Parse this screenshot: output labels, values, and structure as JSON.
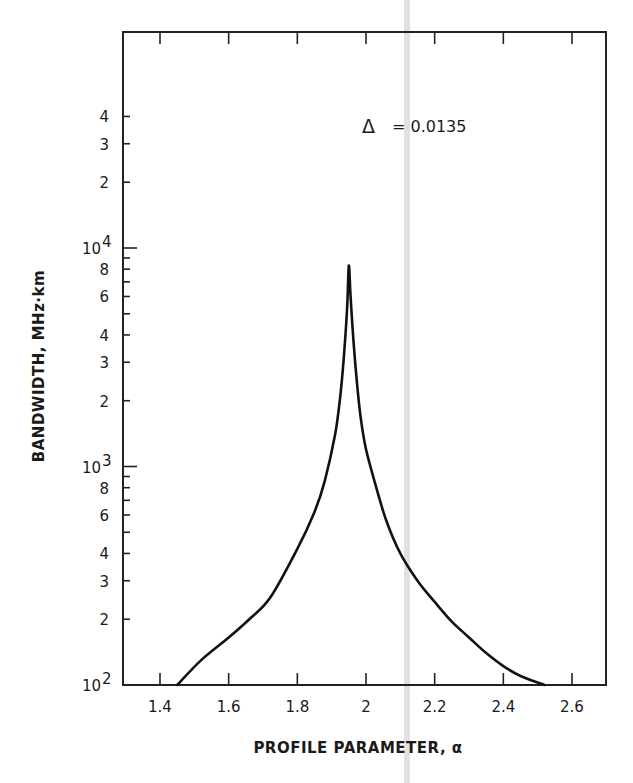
{
  "chart_data": {
    "type": "line",
    "title": "",
    "annotation": {
      "symbol": "Δ",
      "text": "=  0.0135",
      "label": "Δ = 0.0135"
    },
    "xlabel": "PROFILE PARAMETER, α",
    "ylabel": "BANDWIDTH, MHz·km",
    "xlim": [
      1.34,
      2.7
    ],
    "ylim": [
      100,
      50000
    ],
    "yscale": "log",
    "grid": false,
    "legend": "none",
    "x_ticks": [
      {
        "value": 1.4,
        "label": "1.4"
      },
      {
        "value": 1.6,
        "label": "1.6"
      },
      {
        "value": 1.8,
        "label": "1.8"
      },
      {
        "value": 2.0,
        "label": "2"
      },
      {
        "value": 2.2,
        "label": "2.2"
      },
      {
        "value": 2.4,
        "label": "2.4"
      },
      {
        "value": 2.6,
        "label": "2.6"
      }
    ],
    "y_ticks": [
      {
        "value": 100,
        "label": "10",
        "sup": "2",
        "major": true
      },
      {
        "value": 200,
        "label": "2"
      },
      {
        "value": 300,
        "label": "3"
      },
      {
        "value": 400,
        "label": "4"
      },
      {
        "value": 500,
        "label": ""
      },
      {
        "value": 600,
        "label": "6"
      },
      {
        "value": 700,
        "label": ""
      },
      {
        "value": 800,
        "label": "8"
      },
      {
        "value": 900,
        "label": ""
      },
      {
        "value": 1000,
        "label": "10",
        "sup": "3",
        "major": true
      },
      {
        "value": 2000,
        "label": "2"
      },
      {
        "value": 3000,
        "label": "3"
      },
      {
        "value": 4000,
        "label": "4"
      },
      {
        "value": 5000,
        "label": ""
      },
      {
        "value": 6000,
        "label": "6"
      },
      {
        "value": 7000,
        "label": ""
      },
      {
        "value": 8000,
        "label": "8"
      },
      {
        "value": 9000,
        "label": ""
      },
      {
        "value": 10000,
        "label": "10",
        "sup": "4",
        "major": true
      },
      {
        "value": 20000,
        "label": "2"
      },
      {
        "value": 30000,
        "label": "3"
      },
      {
        "value": 40000,
        "label": "4"
      }
    ],
    "series": [
      {
        "name": "Δ = 0.0135",
        "x": [
          1.45,
          1.52,
          1.6,
          1.66,
          1.72,
          1.8,
          1.85,
          1.88,
          1.91,
          1.925,
          1.935,
          1.945,
          1.95,
          1.955,
          1.965,
          1.975,
          1.985,
          2.0,
          2.03,
          2.06,
          2.1,
          2.15,
          2.2,
          2.25,
          2.3,
          2.35,
          2.4,
          2.45,
          2.52
        ],
        "values": [
          100,
          130,
          165,
          200,
          250,
          420,
          620,
          860,
          1400,
          2100,
          3100,
          5300,
          8300,
          6000,
          3500,
          2300,
          1650,
          1200,
          800,
          560,
          400,
          300,
          240,
          195,
          165,
          140,
          122,
          110,
          100
        ]
      }
    ]
  }
}
